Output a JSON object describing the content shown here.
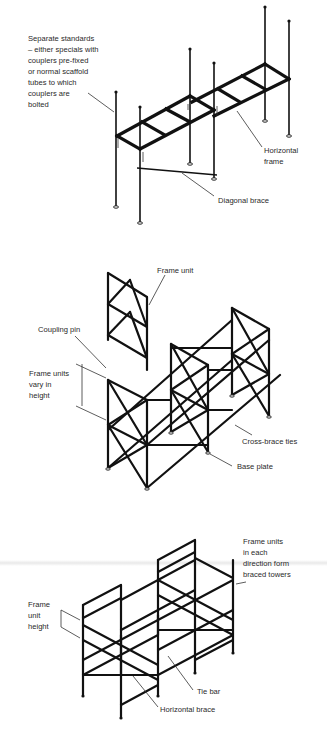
{
  "figure": {
    "panels": [
      {
        "id": "separate-standards",
        "labels": {
          "standards": "Separate standards\n– either specials with\ncouplers pre-fixed\nor normal scaffold\ntubes to which\ncouplers are\nbolted",
          "horizontal_frame": "Horizontal\nframe",
          "diagonal_brace": "Diagonal brace"
        }
      },
      {
        "id": "frame-units",
        "labels": {
          "frame_unit": "Frame unit",
          "coupling_pin": "Coupling pin",
          "frame_units_vary": "Frame units\nvary in\nheight",
          "cross_brace_ties": "Cross-brace ties",
          "base_plate": "Base plate"
        }
      },
      {
        "id": "braced-towers",
        "labels": {
          "frame_units_towers": "Frame units\nin each\ndirection form\nbraced towers",
          "frame_unit_height": "Frame\nunit\nheight",
          "tie_bar": "Tie bar",
          "horizontal_brace": "Horizontal brace"
        }
      }
    ]
  }
}
